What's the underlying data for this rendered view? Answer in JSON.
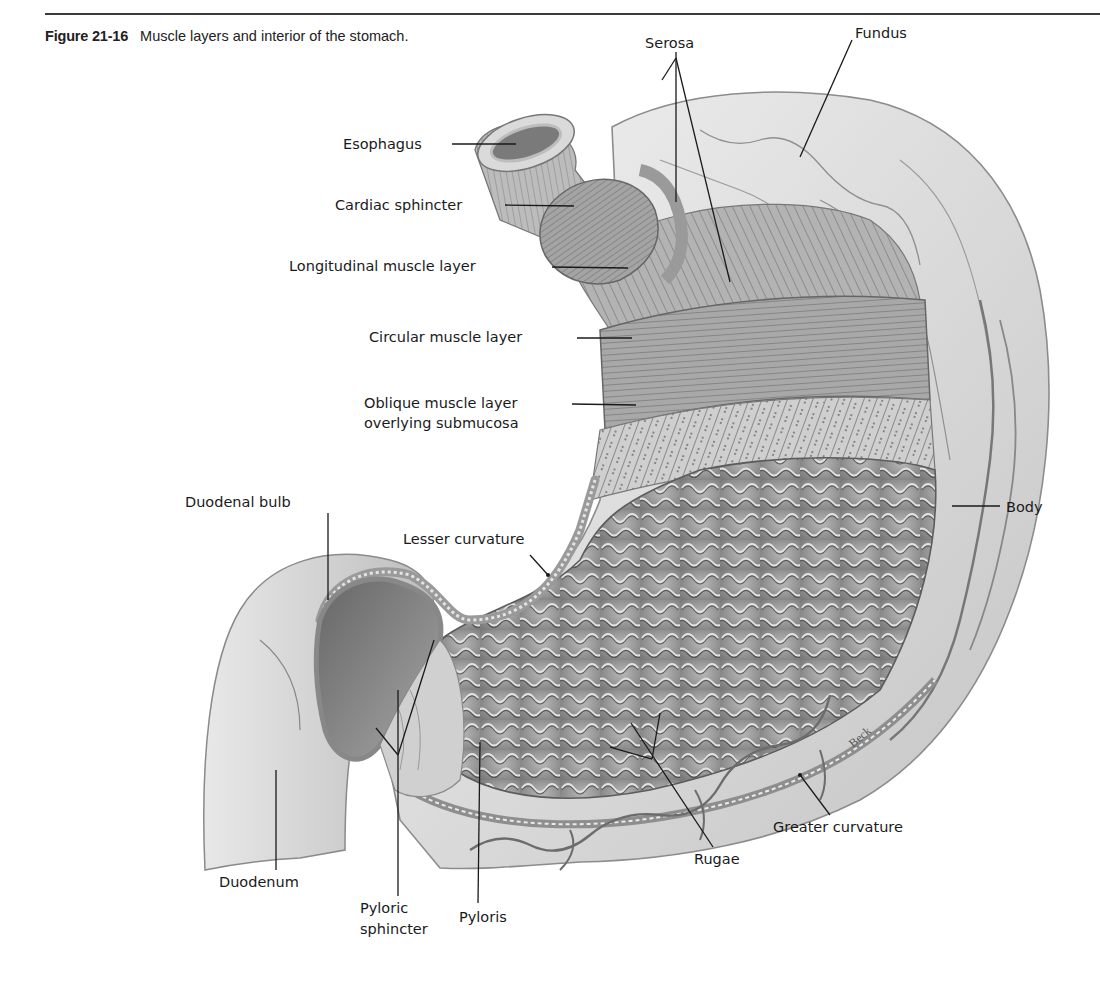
{
  "figure": {
    "number": "Figure 21-16",
    "caption": "Muscle layers and interior of the stomach.",
    "artist_signature": "Beck"
  },
  "labels": [
    {
      "id": "serosa",
      "text": "Serosa",
      "x": 645,
      "y": 34
    },
    {
      "id": "fundus",
      "text": "Fundus",
      "x": 855,
      "y": 24
    },
    {
      "id": "esophagus",
      "text": "Esophagus",
      "x": 343,
      "y": 135
    },
    {
      "id": "cardiac-sphincter",
      "text": "Cardiac sphincter",
      "x": 335,
      "y": 196
    },
    {
      "id": "longitudinal-muscle-layer",
      "text": "Longitudinal muscle layer",
      "x": 289,
      "y": 257
    },
    {
      "id": "circular-muscle-layer",
      "text": "Circular muscle layer",
      "x": 369,
      "y": 328
    },
    {
      "id": "oblique-muscle-layer",
      "text": "Oblique muscle layer",
      "x": 364,
      "y": 394
    },
    {
      "id": "oblique-muscle-layer-line2",
      "text": "overlying submucosa",
      "x": 364,
      "y": 414
    },
    {
      "id": "duodenal-bulb",
      "text": "Duodenal bulb",
      "x": 185,
      "y": 493
    },
    {
      "id": "lesser-curvature",
      "text": "Lesser curvature",
      "x": 403,
      "y": 530
    },
    {
      "id": "body",
      "text": "Body",
      "x": 1006,
      "y": 498
    },
    {
      "id": "greater-curvature",
      "text": "Greater curvature",
      "x": 773,
      "y": 818
    },
    {
      "id": "rugae",
      "text": "Rugae",
      "x": 694,
      "y": 850
    },
    {
      "id": "duodenum",
      "text": "Duodenum",
      "x": 219,
      "y": 873
    },
    {
      "id": "pyloric-sphincter",
      "text": "Pyloric",
      "x": 360,
      "y": 899
    },
    {
      "id": "pyloric-sphincter-line2",
      "text": "sphincter",
      "x": 360,
      "y": 920
    },
    {
      "id": "pyloris",
      "text": "Pyloris",
      "x": 459,
      "y": 908
    }
  ],
  "colors": {
    "rule": "#3a3a3a",
    "text": "#1a1a1a",
    "tissue_light": "#dcdcdc",
    "tissue_mid": "#a9a9a9",
    "tissue_dark": "#707070",
    "leader_line": "#1a1a1a"
  }
}
